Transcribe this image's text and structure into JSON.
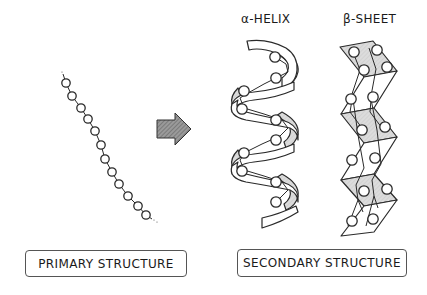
{
  "headings": {
    "alpha_helix": "α-HELIX",
    "beta_sheet": "β-SHEET"
  },
  "labels": {
    "primary": "PRIMARY STRUCTURE",
    "secondary": "SECONDARY STRUCTURE"
  },
  "icons": {
    "transition_arrow": "right-arrow-hatched"
  },
  "colors": {
    "line": "#2a2a2a",
    "panel_fill": "#d9d9d9",
    "arrow_fill": "#8a8a8a",
    "background": "#ffffff"
  },
  "primary_chain": {
    "bead_count": 12
  }
}
